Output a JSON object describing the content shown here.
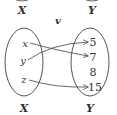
{
  "diagram": {
    "type": "function-mapping",
    "function_name": "v",
    "top_labels": {
      "left": "X",
      "right": "Y"
    },
    "domain": {
      "name": "X",
      "elements": [
        "x",
        "y",
        "z"
      ]
    },
    "codomain": {
      "name": "Y",
      "elements": [
        "5",
        "7",
        "8",
        "15"
      ]
    },
    "mappings": [
      {
        "from": "x",
        "to": "7"
      },
      {
        "from": "y",
        "to": "5"
      },
      {
        "from": "z",
        "to": "15"
      }
    ],
    "colors": {
      "stroke": "#555555",
      "text": "#333333",
      "background": "#ffffff"
    }
  }
}
